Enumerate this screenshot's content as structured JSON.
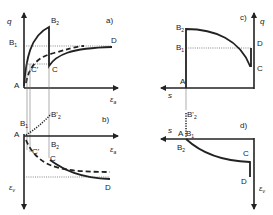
{
  "figure": {
    "panels": [
      {
        "id": "a",
        "label": "a)",
        "y_axis": "q",
        "x_axis": "ε",
        "x_axis_sub": "a",
        "points": [
          "A",
          "B1",
          "B2",
          "C'",
          "C",
          "D"
        ]
      },
      {
        "id": "b",
        "label": "b)",
        "x_axis": "ε",
        "x_axis_sub": "a",
        "y_axis": "ε",
        "y_axis_sub": "v",
        "points": [
          "A",
          "B1",
          "B'2",
          "B2",
          "C'",
          "C",
          "D"
        ]
      },
      {
        "id": "c",
        "label": "c)",
        "x_axis": "s",
        "y_axis": "q",
        "points": [
          "A",
          "B1",
          "B2",
          "C",
          "D"
        ]
      },
      {
        "id": "d",
        "label": "d)",
        "x_axis": "s",
        "y_axis": "ε",
        "y_axis_sub": "v",
        "points": [
          "A",
          "B1",
          "B'2",
          "B2",
          "C",
          "D"
        ]
      }
    ],
    "labels": {
      "q": "q",
      "eps": "ε",
      "sub_a": "a",
      "sub_v": "v",
      "s": "s",
      "A": "A",
      "B": "B",
      "B_prime": "B'",
      "C": "C",
      "C_prime": "C'",
      "D": "D",
      "sub_1": "1",
      "sub_2": "2",
      "panel_a": "a)",
      "panel_b": "b)",
      "panel_c": "c)",
      "panel_d": "d)"
    }
  }
}
